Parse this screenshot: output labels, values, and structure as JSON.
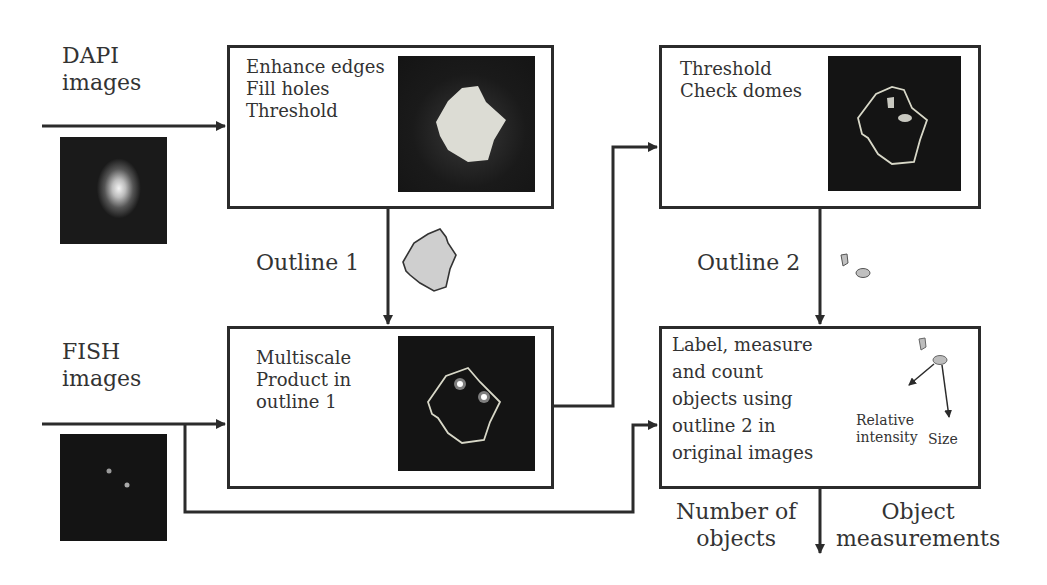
{
  "inputs": {
    "dapi": {
      "line1": "DAPI",
      "line2": "images"
    },
    "fish": {
      "line1": "FISH",
      "line2": "images"
    }
  },
  "boxes": {
    "enhance": {
      "lines": [
        "Enhance edges",
        "Fill holes",
        "Threshold"
      ]
    },
    "threshold": {
      "lines": [
        "Threshold",
        "Check domes"
      ]
    },
    "multiscale": {
      "lines": [
        "Multiscale",
        "Product in",
        "outline 1"
      ]
    },
    "label": {
      "lines": [
        "Label, measure",
        "and count",
        "objects using",
        "outline 2 in",
        "original images"
      ],
      "annotations": {
        "relative_line1": "Relative",
        "relative_line2": "intensity",
        "size": "Size"
      }
    }
  },
  "connectors": {
    "outline1": "Outline 1",
    "outline2": "Outline 2"
  },
  "outputs": {
    "number": {
      "line1": "Number of",
      "line2": "objects"
    },
    "measurements": {
      "line1": "Object",
      "line2": "measurements"
    }
  },
  "colors": {
    "line": "#2b2b2b",
    "image_bg": "#141414",
    "outline": "#d8d8c8",
    "blob_fill": "#c8c8c8"
  }
}
